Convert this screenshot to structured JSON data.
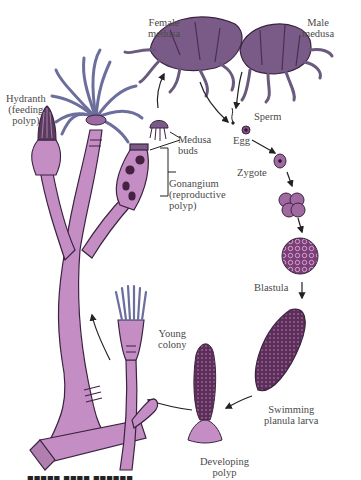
{
  "figure": {
    "colors": {
      "polyp_body": "#c48ec4",
      "polyp_outline": "#3a2340",
      "tentacle": "#6c6e9c",
      "medusa": "#7a5a86",
      "embryo": "#8a4f86",
      "arrow": "#222222"
    }
  },
  "labels": {
    "female_medusa": "Female\nmedusa",
    "male_medusa": "Male\nmedusa",
    "hydranth": "Hydranth\n(feeding\npolyp)",
    "medusa_buds": "Medusa\nbuds",
    "gonangium": "Gonangium\n(reproductive\npolyp)",
    "sperm": "Sperm",
    "egg": "Egg",
    "zygote": "Zygote",
    "blastula": "Blastula",
    "planula": "Swimming\nplanula larva",
    "developing_polyp": "Developing\npolyp",
    "young_colony": "Young\ncolony"
  },
  "cycle_order": [
    "Female medusa",
    "Male medusa",
    "Sperm",
    "Egg",
    "Zygote",
    "Blastula",
    "Swimming planula larva",
    "Developing polyp",
    "Young colony",
    "Hydranth (feeding polyp)",
    "Gonangium (reproductive polyp)",
    "Medusa buds"
  ]
}
